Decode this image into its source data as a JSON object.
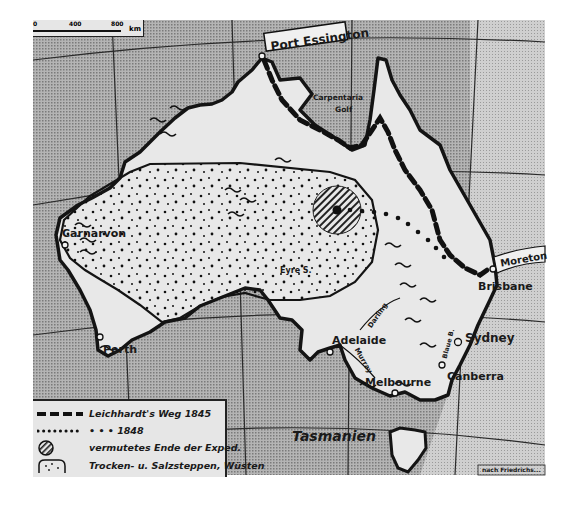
{
  "scale_bar": {
    "ticks": [
      "0",
      "400",
      "800"
    ],
    "unit": "km"
  },
  "labels": {
    "port_essington": "Port Essington",
    "carpentaria_line1": "Carpentaria",
    "carpentaria_line2": "Golf",
    "carnarvon": "Carnarvon",
    "perth": "Perth",
    "eyre": "Eyre S.",
    "adelaide": "Adelaide",
    "darling": "Darling",
    "murray": "Murray",
    "melbourne": "Melbourne",
    "canberra": "Canberra",
    "sydney": "Sydney",
    "blaue_berge": "Blaue B.",
    "brisbane": "Brisbane",
    "moreton": "Moreton",
    "tasmanien": "Tasmanien"
  },
  "legend": {
    "items": [
      {
        "symbol": "dashed-route-icon",
        "label": "Leichhardt's Weg 1845"
      },
      {
        "symbol": "dotted-route-icon",
        "label": "•   •   •  1848"
      },
      {
        "symbol": "hatched-circle-icon",
        "label": "vermutetes Ende der Exped."
      },
      {
        "symbol": "dotted-area-icon",
        "label": "Trocken- u. Salzsteppen, Wüsten"
      }
    ]
  },
  "footer": {
    "left_fragment": "nach ...",
    "credit_fragment": "nach Friedrichs..."
  },
  "colors": {
    "sea": "#9a9a9a",
    "land": "#e8e8e8",
    "outline": "#141414",
    "route": "#111111"
  }
}
